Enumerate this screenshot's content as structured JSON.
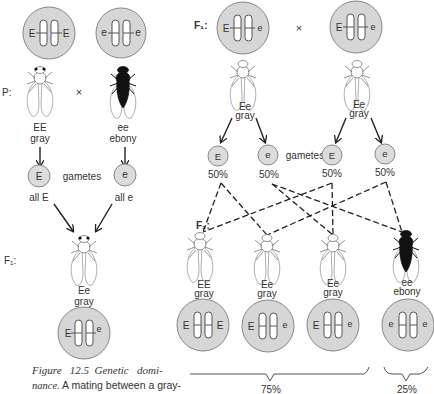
{
  "parental": {
    "label": "P:",
    "cross_symbol": "×",
    "left": {
      "cell_alleles": [
        "E",
        "E"
      ],
      "genotype": "EE",
      "phenotype": "gray",
      "color": "gray"
    },
    "right": {
      "cell_alleles": [
        "e",
        "e"
      ],
      "genotype": "ee",
      "phenotype": "ebony",
      "color": "ebony"
    },
    "gametes_label": "gametes",
    "left_gamete": {
      "allele": "E",
      "caption": "all E"
    },
    "right_gamete": {
      "allele": "e",
      "caption": "all e"
    }
  },
  "f1_left": {
    "label": "F₁:",
    "genotype": "Ee",
    "phenotype": "gray",
    "cell_alleles": [
      "E",
      "e"
    ]
  },
  "f1_cross": {
    "label": "F₁:",
    "cross_symbol": "×",
    "parents": [
      {
        "cell_alleles": [
          "E",
          "e"
        ],
        "genotype": "Ee",
        "phenotype": "gray"
      },
      {
        "cell_alleles": [
          "E",
          "e"
        ],
        "genotype": "Ee",
        "phenotype": "gray"
      }
    ],
    "gametes_label": "gametes",
    "gametes": [
      {
        "allele": "E",
        "percent": "50%"
      },
      {
        "allele": "e",
        "percent": "50%"
      },
      {
        "allele": "E",
        "percent": "50%"
      },
      {
        "allele": "e",
        "percent": "50%"
      }
    ]
  },
  "f2": {
    "label": "F₂:",
    "offspring": [
      {
        "genotype": "EE",
        "phenotype": "gray",
        "cell_alleles": [
          "E",
          "E"
        ],
        "color": "gray"
      },
      {
        "genotype": "Ee",
        "phenotype": "gray",
        "cell_alleles": [
          "E",
          "e"
        ],
        "color": "gray"
      },
      {
        "genotype": "Ee",
        "phenotype": "gray",
        "cell_alleles": [
          "E",
          "e"
        ],
        "color": "gray"
      },
      {
        "genotype": "ee",
        "phenotype": "ebony",
        "cell_alleles": [
          "e",
          "e"
        ],
        "color": "ebony"
      }
    ],
    "ratios": [
      {
        "group": "gray",
        "percent": "75%"
      },
      {
        "group": "ebony",
        "percent": "25%"
      }
    ]
  },
  "caption": {
    "line1": "Figure   12.5  Genetic   domi-",
    "line2_italic": "nance.",
    "line2_rest": " A mating between a gray-"
  }
}
